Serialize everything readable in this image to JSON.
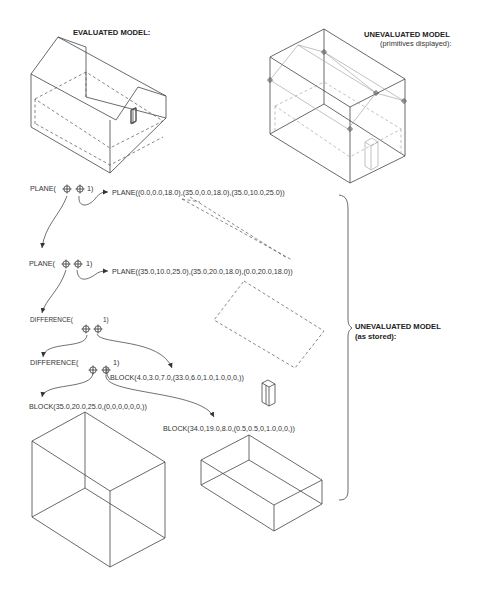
{
  "headings": {
    "evaluated": "EVALUATED MODEL:",
    "unevaluated_display": "UNEVALUATED MODEL",
    "unevaluated_display_sub": "(primitives displayed):",
    "unevaluated_stored": "UNEVALUATED MODEL",
    "unevaluated_stored_sub": "(as stored):"
  },
  "tree": {
    "plane1_node": "PLANE(",
    "plane1_tail": "1)",
    "plane1_def": "PLANE((0.0,0.0,18.0),(35.0,0.0,18.0),(35.0,10.0,25.0))",
    "plane2_node": "PLANE(",
    "plane2_tail": "1)",
    "plane2_def": "PLANE((35.0,10.0,25.0),(35.0,20.0,18.0),(0.0,20.0,18.0))",
    "diff1_node": "DIFFERENCE(",
    "diff1_tail": "1)",
    "diff2_node": "DIFFERENCE(",
    "diff2_tail": "1)",
    "block_door": "BLOCK(4.0,3.0,7.0,(33.0,6.0,1.0,1.0,0,0,))",
    "block_outer": "BLOCK(35.0,20.0,25.0,(0,0,0,0,0,0,))",
    "block_inner": "BLOCK(34.0,19.0,8.0,(0.5,0.5,0,1.0,0,0,))"
  },
  "icons": {
    "pointer": "crosshair-pointer-icon"
  }
}
